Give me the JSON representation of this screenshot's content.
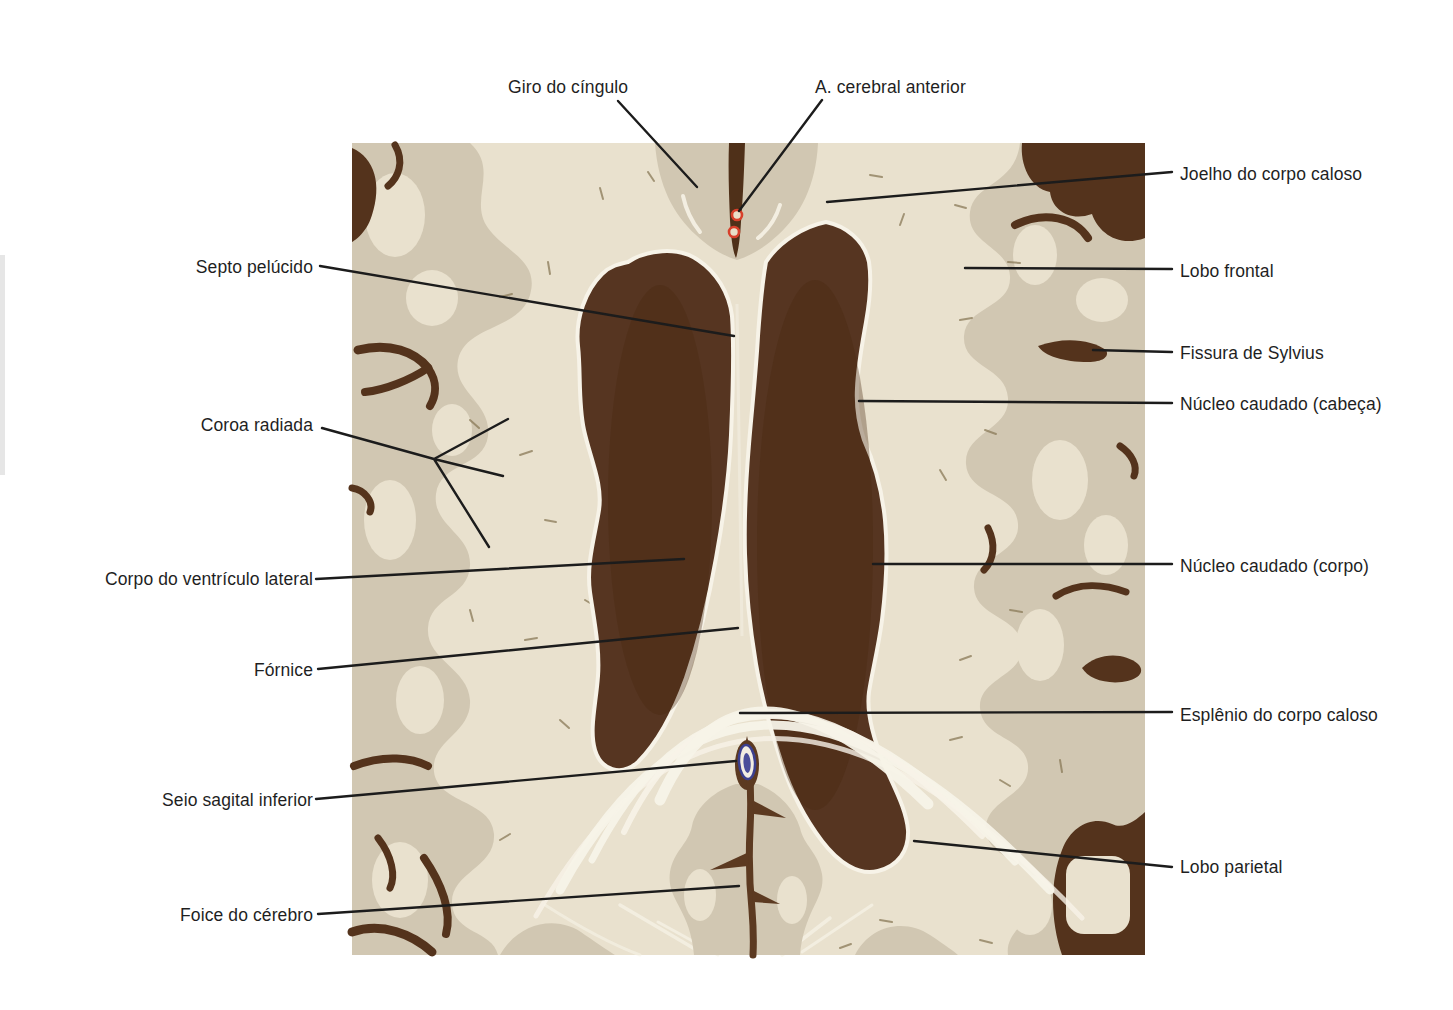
{
  "figure": {
    "language": "pt-BR"
  },
  "colors": {
    "page_background": "#ffffff",
    "canvas_cream": "#e9e1ce",
    "cortex_tan": "#d1c7b2",
    "sulcus_brown": "#54331c",
    "mass_brown": "#563521",
    "white_outline": "#f7f3e8",
    "artery_red": "#d8402b",
    "sinus_blue": "#3b3f8e",
    "leader_line": "#1c1c1c"
  },
  "labels": {
    "top": [
      {
        "text": "Giro do cíngulo"
      },
      {
        "text": "A. cerebral anterior"
      }
    ],
    "left": [
      {
        "text": "Septo pelúcido"
      },
      {
        "text": "Coroa radiada"
      },
      {
        "text": "Corpo do ventrículo lateral"
      },
      {
        "text": "Fórnice"
      },
      {
        "text": "Seio sagital inferior"
      },
      {
        "text": "Foice do cérebro"
      }
    ],
    "right": [
      {
        "text": "Joelho do corpo caloso"
      },
      {
        "text": "Lobo frontal"
      },
      {
        "text": "Fissura de Sylvius"
      },
      {
        "text": "Núcleo caudado (cabeça)"
      },
      {
        "text": "Núcleo caudado (corpo)"
      },
      {
        "text": "Esplênio do corpo caloso"
      },
      {
        "text": "Lobo parietal"
      }
    ]
  }
}
